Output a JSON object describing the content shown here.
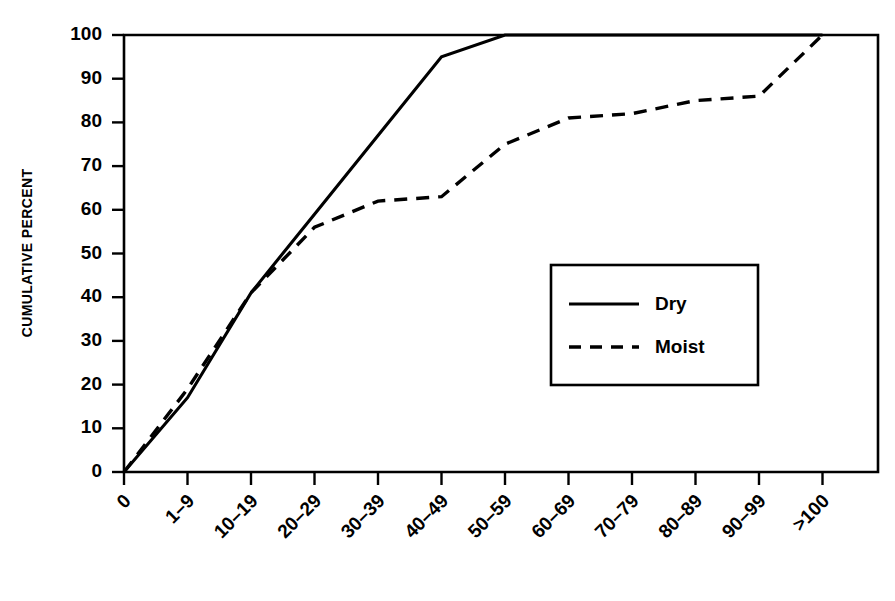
{
  "chart_data": {
    "type": "line",
    "title": "",
    "xlabel": "",
    "ylabel": "CUMULATIVE PERCENT",
    "ylim": [
      0,
      100
    ],
    "ytick_values": [
      0,
      10,
      20,
      30,
      40,
      50,
      60,
      70,
      80,
      90,
      100
    ],
    "ytick_labels": [
      "0",
      "10",
      "20",
      "30",
      "40",
      "50",
      "60",
      "70",
      "80",
      "90",
      "100"
    ],
    "categories": [
      "0",
      "1–9",
      "10–19",
      "20–29",
      "30–39",
      "40–49",
      "50–59",
      "60–69",
      "70–79",
      "80–89",
      "90–99",
      ">100"
    ],
    "grid": false,
    "legend_position": "center-right",
    "series": [
      {
        "name": "Dry",
        "style": "solid",
        "color": "#000000",
        "values": [
          0,
          17,
          41,
          59,
          77,
          95,
          100,
          100,
          100,
          100,
          100,
          100
        ]
      },
      {
        "name": "Moist",
        "style": "dashed",
        "color": "#000000",
        "values": [
          0,
          19,
          41,
          56,
          62,
          63,
          75,
          81,
          82,
          85,
          86,
          100
        ]
      }
    ]
  },
  "legend": {
    "entries": [
      {
        "label": "Dry",
        "style": "solid"
      },
      {
        "label": "Moist",
        "style": "dashed"
      }
    ]
  },
  "axes": {
    "y_title": "CUMULATIVE PERCENT"
  },
  "colors": {
    "ink": "#000000",
    "background": "#ffffff"
  }
}
